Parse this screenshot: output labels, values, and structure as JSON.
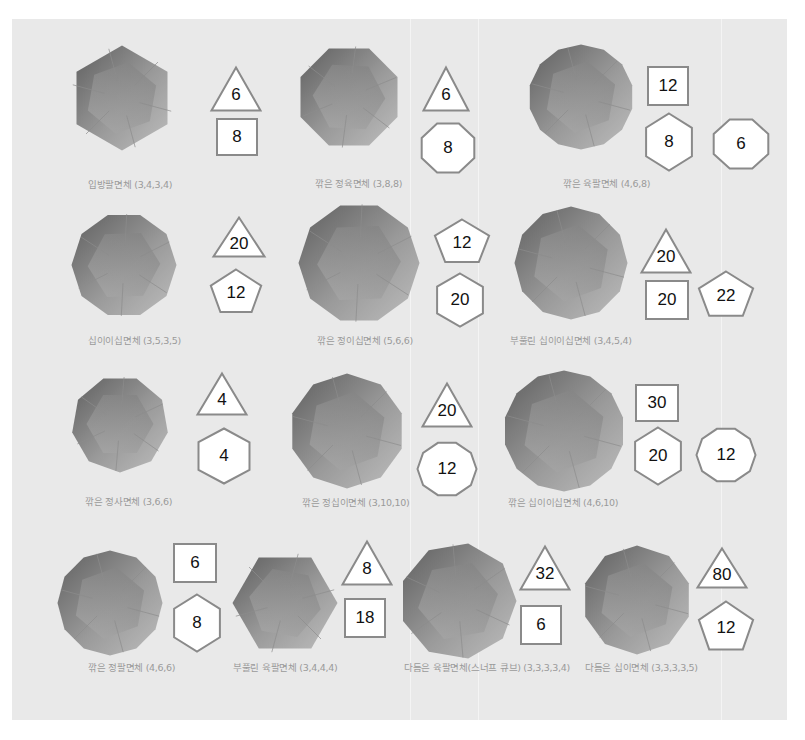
{
  "colors": {
    "panel_bg": "#e9e9e9",
    "badge_fill": "#ffffff",
    "badge_stroke": "#8a8a8a",
    "caption": "#9a9a9a",
    "solid_dark": "#5f5f5f",
    "solid_light": "#bdbdbd"
  },
  "solids": [
    {
      "name": "입방팔면체",
      "vertex_config": "(3,4,3,4)",
      "caption": "입방팔면체 (3,4,3,4)",
      "faces": [
        {
          "shape": "triangle",
          "count": "6"
        },
        {
          "shape": "square",
          "count": "8"
        }
      ]
    },
    {
      "name": "깎은 정육면체",
      "vertex_config": "(3,8,8)",
      "caption": "깎은 정육면체 (3,8,8)",
      "faces": [
        {
          "shape": "triangle",
          "count": "6"
        },
        {
          "shape": "octagon",
          "count": "8"
        }
      ]
    },
    {
      "name": "깎은 육팔면체",
      "vertex_config": "(4,6,8)",
      "caption": "깎은 육팔면체 (4,6,8)",
      "faces": [
        {
          "shape": "square",
          "count": "12"
        },
        {
          "shape": "hexagon",
          "count": "8"
        },
        {
          "shape": "octagon",
          "count": "6"
        }
      ]
    },
    {
      "name": "십이이십면체",
      "vertex_config": "(3,5,3,5)",
      "caption": "십이이십면체 (3,5,3,5)",
      "faces": [
        {
          "shape": "triangle",
          "count": "20"
        },
        {
          "shape": "pentagon",
          "count": "12"
        }
      ]
    },
    {
      "name": "깎은 정이십면체",
      "vertex_config": "(5,6,6)",
      "caption": "깎은 정이십면체 (5,6,6)",
      "faces": [
        {
          "shape": "pentagon",
          "count": "12"
        },
        {
          "shape": "hexagon",
          "count": "20"
        }
      ]
    },
    {
      "name": "부풀린 십이이십면체",
      "vertex_config": "(3,4,5,4)",
      "caption": "부풀린 십이이십면체 (3,4,5,4)",
      "faces": [
        {
          "shape": "triangle",
          "count": "20"
        },
        {
          "shape": "square",
          "count": "20"
        },
        {
          "shape": "pentagon",
          "count": "22"
        }
      ]
    },
    {
      "name": "깎은 정사면체",
      "vertex_config": "(3,6,6)",
      "caption": "깎은 정사면체 (3,6,6)",
      "faces": [
        {
          "shape": "triangle",
          "count": "4"
        },
        {
          "shape": "hexagon",
          "count": "4"
        }
      ]
    },
    {
      "name": "깎은 정십이면체",
      "vertex_config": "(3,10,10)",
      "caption": "깎은 정십이면체 (3,10,10)",
      "faces": [
        {
          "shape": "triangle",
          "count": "20"
        },
        {
          "shape": "decagon",
          "count": "12"
        }
      ]
    },
    {
      "name": "깎은 십이이십면체",
      "vertex_config": "(4,6,10)",
      "caption": "깎은 십이이십면체 (4,6,10)",
      "faces": [
        {
          "shape": "square",
          "count": "30"
        },
        {
          "shape": "hexagon",
          "count": "20"
        },
        {
          "shape": "decagon",
          "count": "12"
        }
      ]
    },
    {
      "name": "깎은 정팔면체",
      "vertex_config": "(4,6,6)",
      "caption": "깎은 정팔면체 (4,6,6)",
      "faces": [
        {
          "shape": "square",
          "count": "6"
        },
        {
          "shape": "hexagon",
          "count": "8"
        }
      ]
    },
    {
      "name": "부풀린 육팔면체",
      "vertex_config": "(3,4,4,4)",
      "caption": "부풀린 육팔면체 (3,4,4,4)",
      "faces": [
        {
          "shape": "triangle",
          "count": "8"
        },
        {
          "shape": "square",
          "count": "18"
        }
      ]
    },
    {
      "name": "다듬은 육팔면체(스너프 큐브)",
      "vertex_config": "(3,3,3,3,4)",
      "caption": "다듬은 육팔면체(스너프 큐브) (3,3,3,3,4)",
      "faces": [
        {
          "shape": "triangle",
          "count": "32"
        },
        {
          "shape": "square",
          "count": "6"
        }
      ]
    },
    {
      "name": "다듬은 십이면체",
      "vertex_config": "(3,3,3,3,5)",
      "caption": "다듬은 십이면체 (3,3,3,3,5)",
      "faces": [
        {
          "shape": "triangle",
          "count": "80"
        },
        {
          "shape": "pentagon",
          "count": "12"
        }
      ]
    }
  ]
}
